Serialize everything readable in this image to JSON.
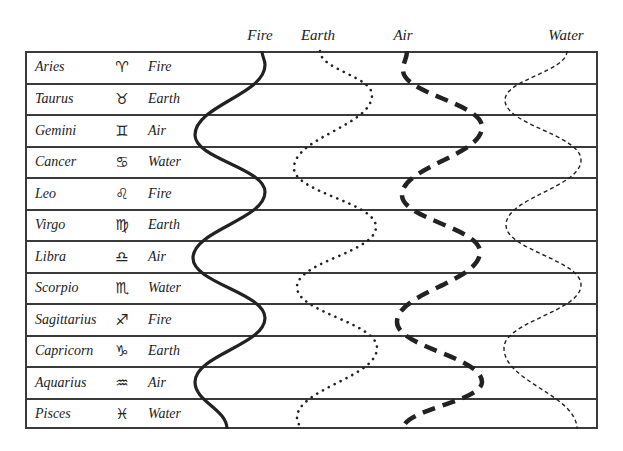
{
  "header": {
    "columns": [
      {
        "label": "Fire",
        "x": 260
      },
      {
        "label": "Earth",
        "x": 318
      },
      {
        "label": "Air",
        "x": 403
      },
      {
        "label": "Water",
        "x": 566
      }
    ]
  },
  "rows": [
    {
      "sign": "Aries",
      "symbol": "♈︎",
      "element": "Fire"
    },
    {
      "sign": "Taurus",
      "symbol": "♉︎",
      "element": "Earth"
    },
    {
      "sign": "Gemini",
      "symbol": "♊︎",
      "element": "Air"
    },
    {
      "sign": "Cancer",
      "symbol": "♋︎",
      "element": "Water"
    },
    {
      "sign": "Leo",
      "symbol": "♌︎",
      "element": "Fire"
    },
    {
      "sign": "Virgo",
      "symbol": "♍︎",
      "element": "Earth"
    },
    {
      "sign": "Libra",
      "symbol": "♎︎",
      "element": "Air"
    },
    {
      "sign": "Scorpio",
      "symbol": "♏︎",
      "element": "Water"
    },
    {
      "sign": "Sagittarius",
      "symbol": "♐︎",
      "element": "Fire"
    },
    {
      "sign": "Capricorn",
      "symbol": "♑︎",
      "element": "Earth"
    },
    {
      "sign": "Aquarius",
      "symbol": "♒︎",
      "element": "Air"
    },
    {
      "sign": "Pisces",
      "symbol": "♓︎",
      "element": "Water"
    }
  ],
  "curves": [
    {
      "name": "fire-curve",
      "element": "Fire",
      "style": "solid",
      "width": 3.2,
      "dash": "",
      "points": [
        [
          262,
          51
        ],
        [
          265,
          65
        ],
        [
          195,
          135
        ],
        [
          265,
          192
        ],
        [
          193,
          258
        ],
        [
          265,
          318
        ],
        [
          195,
          382
        ],
        [
          227,
          429
        ]
      ]
    },
    {
      "name": "earth-curve",
      "element": "Earth",
      "style": "dotted",
      "width": 2.6,
      "dash": "0.1 6.5",
      "points": [
        [
          320,
          51
        ],
        [
          372,
          95
        ],
        [
          294,
          168
        ],
        [
          376,
          227
        ],
        [
          297,
          287
        ],
        [
          377,
          348
        ],
        [
          297,
          418
        ],
        [
          300,
          429
        ]
      ]
    },
    {
      "name": "air-curve",
      "element": "Air",
      "style": "heavy-dashed",
      "width": 4.5,
      "dash": "13 8",
      "points": [
        [
          407,
          51
        ],
        [
          403,
          70
        ],
        [
          482,
          127
        ],
        [
          402,
          195
        ],
        [
          480,
          252
        ],
        [
          397,
          322
        ],
        [
          482,
          382
        ],
        [
          403,
          429
        ]
      ]
    },
    {
      "name": "water-curve",
      "element": "Water",
      "style": "thin-dashed",
      "width": 1.4,
      "dash": "4 3",
      "points": [
        [
          567,
          51
        ],
        [
          505,
          100
        ],
        [
          581,
          160
        ],
        [
          506,
          225
        ],
        [
          581,
          285
        ],
        [
          504,
          348
        ],
        [
          577,
          429
        ]
      ]
    }
  ],
  "colors": {
    "line": "#222222",
    "border": "#3a3a3a",
    "text": "#222222"
  }
}
